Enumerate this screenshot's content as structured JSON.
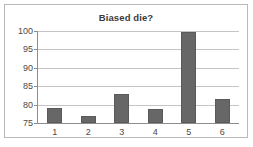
{
  "chart_data": {
    "type": "bar",
    "title": "Biased die?",
    "xlabel": "",
    "ylabel": "",
    "categories": [
      "1",
      "2",
      "3",
      "4",
      "5",
      "6"
    ],
    "values": [
      79,
      76.8,
      82.8,
      78.7,
      99.8,
      81.6
    ],
    "ylim": [
      75,
      100
    ],
    "yticks": [
      75,
      80,
      85,
      90,
      95,
      100
    ],
    "ytick_labels": [
      "75",
      "80",
      "85",
      "90",
      "95",
      "100"
    ],
    "grid": true,
    "legend": false,
    "bar_color": "#676767",
    "grid_color": "#c4c4c4",
    "axis_color": "#8d8d8d",
    "frame_color": "#b9b9b9",
    "text_color": "#4a4a4a",
    "title_color": "#3b3b3b"
  }
}
